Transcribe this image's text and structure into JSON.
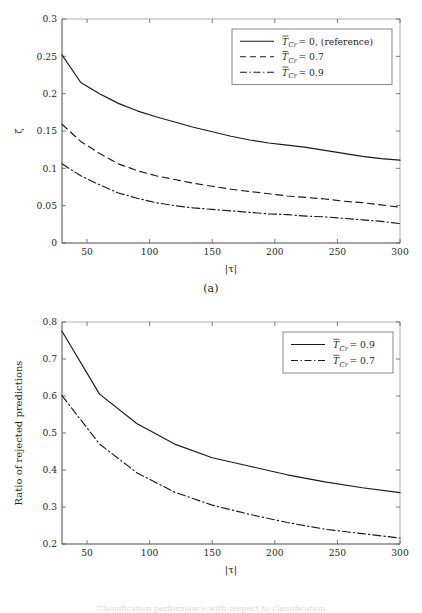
{
  "figure": {
    "subcaption_a": "(a)",
    "subcaption_b": "(b)",
    "bottom_caption_fragment": "Classification performance with respect to classification"
  },
  "chart_data": [
    {
      "id": "panel-a",
      "type": "line",
      "title": "",
      "subcaption": "(a)",
      "xlabel": "|τ|",
      "ylabel": "ζ",
      "xlim": [
        30,
        300
      ],
      "ylim": [
        0,
        0.3
      ],
      "xticks": [
        50,
        100,
        150,
        200,
        250,
        300
      ],
      "xticklabels": [
        "50",
        "100",
        "150",
        "200",
        "250",
        "300"
      ],
      "yticks": [
        0,
        0.05,
        0.1,
        0.15,
        0.2,
        0.25,
        0.3
      ],
      "yticklabels": [
        "0",
        "0.05",
        "0.1",
        "0.15",
        "0.2",
        "0.25",
        "0.3"
      ],
      "grid": false,
      "legend_position": "upper right",
      "x": [
        30,
        45,
        60,
        75,
        90,
        105,
        120,
        135,
        150,
        165,
        180,
        195,
        210,
        225,
        240,
        255,
        270,
        285,
        300
      ],
      "series": [
        {
          "name": "T̄_Cr = 0, (reference)",
          "legend_label": "T̄_Cr = 0, (reference)",
          "style": "solid",
          "color": "#1a1a1a",
          "values": [
            0.252,
            0.215,
            0.2,
            0.187,
            0.177,
            0.169,
            0.162,
            0.155,
            0.149,
            0.143,
            0.138,
            0.134,
            0.131,
            0.128,
            0.124,
            0.12,
            0.116,
            0.113,
            0.111
          ]
        },
        {
          "name": "T̄_Cr = 0.7",
          "legend_label": "T̄_Cr = 0.7",
          "style": "dashed",
          "color": "#1a1a1a",
          "values": [
            0.159,
            0.136,
            0.12,
            0.106,
            0.097,
            0.09,
            0.085,
            0.08,
            0.076,
            0.072,
            0.069,
            0.066,
            0.063,
            0.061,
            0.059,
            0.056,
            0.054,
            0.051,
            0.048
          ]
        },
        {
          "name": "T̄_Cr = 0.9",
          "legend_label": "T̄_Cr = 0.9",
          "style": "dashdot",
          "color": "#1a1a1a",
          "values": [
            0.106,
            0.09,
            0.078,
            0.067,
            0.06,
            0.054,
            0.05,
            0.047,
            0.045,
            0.043,
            0.041,
            0.039,
            0.038,
            0.036,
            0.035,
            0.033,
            0.031,
            0.029,
            0.026
          ]
        }
      ]
    },
    {
      "id": "panel-b",
      "type": "line",
      "title": "",
      "subcaption": "(b)",
      "xlabel": "|τ|",
      "ylabel": "Ratio of rejected predictions",
      "xlim": [
        30,
        300
      ],
      "ylim": [
        0.2,
        0.8
      ],
      "xticks": [
        50,
        100,
        150,
        200,
        250,
        300
      ],
      "xticklabels": [
        "50",
        "100",
        "150",
        "200",
        "250",
        "300"
      ],
      "yticks": [
        0.2,
        0.3,
        0.4,
        0.5,
        0.6,
        0.7,
        0.8
      ],
      "yticklabels": [
        "0.2",
        "0.3",
        "0.4",
        "0.5",
        "0.6",
        "0.7",
        "0.8"
      ],
      "grid": false,
      "legend_position": "upper right",
      "x": [
        30,
        60,
        90,
        120,
        150,
        180,
        210,
        240,
        270,
        300
      ],
      "series": [
        {
          "name": "T̄_Cr = 0.9",
          "legend_label": "T̄_Cr = 0.9",
          "style": "solid",
          "color": "#1a1a1a",
          "values": [
            0.775,
            0.605,
            0.525,
            0.47,
            0.433,
            0.41,
            0.387,
            0.368,
            0.352,
            0.339
          ]
        },
        {
          "name": "T̄_Cr = 0.7",
          "legend_label": "T̄_Cr = 0.7",
          "style": "dashdot",
          "color": "#1a1a1a",
          "values": [
            0.601,
            0.47,
            0.392,
            0.34,
            0.305,
            0.28,
            0.258,
            0.24,
            0.228,
            0.216
          ]
        }
      ]
    }
  ],
  "legend_symbols": {
    "t_bar_cr": "T̄",
    "subscript_cr": "Cr",
    "eq_zero_reference": "= 0, (reference)",
    "eq_07": "= 0.7",
    "eq_09": "= 0.9"
  }
}
